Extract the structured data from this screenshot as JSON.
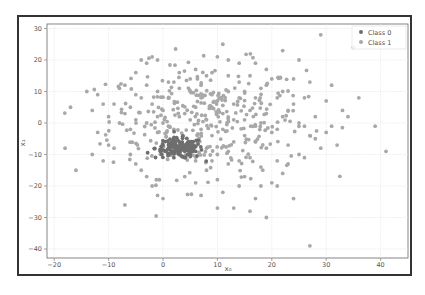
{
  "chart_data": {
    "type": "scatter",
    "title": "",
    "xlabel": "x₀",
    "ylabel": "x₁",
    "xlim": [
      -21.5,
      45
    ],
    "ylim": [
      -42,
      31
    ],
    "x_ticks": [
      -20,
      -10,
      0,
      10,
      20,
      30,
      40
    ],
    "y_ticks": [
      -40,
      -30,
      -20,
      -10,
      0,
      10,
      20,
      30
    ],
    "grid": true,
    "legend_position": "upper right",
    "series": [
      {
        "name": "Class 0",
        "color": "#6e6e6e",
        "cluster_center": [
          3,
          -8
        ],
        "cluster_spread": [
          2.2,
          1.6
        ],
        "approx_count": 150,
        "points": [
          [
            0,
            -7
          ],
          [
            1,
            -8
          ],
          [
            2,
            -9
          ],
          [
            3,
            -8
          ],
          [
            4,
            -7
          ],
          [
            5,
            -8
          ],
          [
            6,
            -9
          ],
          [
            1,
            -10
          ],
          [
            2,
            -6
          ],
          [
            3,
            -10
          ],
          [
            4,
            -9
          ],
          [
            5,
            -6
          ],
          [
            0.5,
            -9
          ],
          [
            2.5,
            -7.5
          ],
          [
            3.5,
            -8.5
          ],
          [
            4.5,
            -10
          ],
          [
            1.5,
            -6.5
          ],
          [
            5.5,
            -7
          ],
          [
            0,
            -8.5
          ],
          [
            6,
            -7.5
          ],
          [
            2,
            -11
          ],
          [
            3,
            -6
          ],
          [
            4,
            -11
          ],
          [
            1,
            -7
          ],
          [
            5,
            -10
          ]
        ]
      },
      {
        "name": "Class 1",
        "color": "#a8a8a8",
        "approx_count": 500,
        "points": [
          [
            -17,
            5
          ],
          [
            -14,
            10
          ],
          [
            -12,
            9
          ],
          [
            -11,
            6
          ],
          [
            -9,
            6
          ],
          [
            -8,
            11
          ],
          [
            -7,
            3
          ],
          [
            -7,
            12
          ],
          [
            -6,
            5
          ],
          [
            -5,
            16
          ],
          [
            -4,
            20
          ],
          [
            -3,
            19
          ],
          [
            -2,
            21
          ],
          [
            -1,
            20
          ],
          [
            -5,
            1
          ],
          [
            -3,
            0
          ],
          [
            -1,
            2
          ],
          [
            0,
            4
          ],
          [
            1,
            8
          ],
          [
            2,
            13
          ],
          [
            3,
            16
          ],
          [
            -18,
            -8
          ],
          [
            -16,
            -15
          ],
          [
            -13,
            -10
          ],
          [
            -10,
            -7
          ],
          [
            -11,
            -12
          ],
          [
            -9,
            -8
          ],
          [
            -6,
            -10
          ],
          [
            -5,
            -13
          ],
          [
            -4,
            -15
          ],
          [
            -3,
            -17
          ],
          [
            -2,
            -20
          ],
          [
            -7,
            -26
          ],
          [
            -1,
            -23
          ],
          [
            0,
            -24
          ],
          [
            4,
            -17
          ],
          [
            6,
            -19
          ],
          [
            7,
            -23
          ],
          [
            8,
            -15
          ],
          [
            9,
            -12
          ],
          [
            10,
            -18
          ],
          [
            11,
            -22
          ],
          [
            12,
            -13
          ],
          [
            13,
            -27
          ],
          [
            14,
            -20
          ],
          [
            15,
            -17
          ],
          [
            16,
            -11
          ],
          [
            17,
            -24
          ],
          [
            18,
            -14
          ],
          [
            19,
            -30
          ],
          [
            20,
            -19
          ],
          [
            21,
            -12
          ],
          [
            22,
            -16
          ],
          [
            24,
            -24
          ],
          [
            27,
            -39
          ],
          [
            26,
            -11
          ],
          [
            28,
            -5
          ],
          [
            30,
            -3
          ],
          [
            32,
            -7
          ],
          [
            34,
            2
          ],
          [
            36,
            8
          ],
          [
            39,
            -1
          ],
          [
            41,
            -9
          ],
          [
            35,
            24
          ],
          [
            29,
            28
          ],
          [
            31,
            12
          ],
          [
            25,
            20
          ],
          [
            22,
            23
          ],
          [
            19,
            17
          ],
          [
            17,
            19
          ],
          [
            14,
            19
          ],
          [
            12,
            20
          ],
          [
            11,
            25
          ],
          [
            10,
            21
          ],
          [
            8,
            15
          ],
          [
            6,
            17
          ],
          [
            5,
            10
          ],
          [
            7,
            8
          ],
          [
            9,
            5
          ],
          [
            11,
            3
          ],
          [
            13,
            6
          ],
          [
            15,
            10
          ],
          [
            16,
            4
          ],
          [
            18,
            0
          ],
          [
            20,
            -3
          ],
          [
            22,
            2
          ],
          [
            24,
            6
          ],
          [
            26,
            -1
          ],
          [
            23,
            -7
          ],
          [
            21,
            8
          ],
          [
            19,
            12
          ],
          [
            17,
            8
          ],
          [
            15,
            -4
          ],
          [
            13,
            -6
          ],
          [
            11,
            -2
          ],
          [
            9,
            -4
          ],
          [
            7,
            -2
          ],
          [
            5,
            1
          ],
          [
            3,
            2
          ],
          [
            1,
            -1
          ],
          [
            -1,
            -3
          ],
          [
            -2,
            6
          ],
          [
            -4,
            8
          ],
          [
            -6,
            -2
          ],
          [
            -8,
            0
          ],
          [
            -10,
            2
          ],
          [
            -12,
            -3
          ],
          [
            -13,
            4
          ],
          [
            12,
            15
          ],
          [
            14,
            13
          ],
          [
            16,
            15
          ],
          [
            18,
            11
          ],
          [
            20,
            14
          ],
          [
            22,
            10
          ],
          [
            24,
            14
          ],
          [
            26,
            8
          ],
          [
            28,
            2
          ],
          [
            30,
            7
          ],
          [
            27,
            13
          ],
          [
            25,
            -10
          ],
          [
            23,
            -13
          ],
          [
            21,
            -20
          ],
          [
            18,
            -20
          ],
          [
            16,
            -28
          ],
          [
            10,
            -27
          ],
          [
            8,
            -8
          ],
          [
            6,
            -12
          ],
          [
            10,
            -10
          ],
          [
            12,
            -9
          ],
          [
            14,
            -12
          ],
          [
            17,
            -6
          ],
          [
            19,
            -8
          ],
          [
            21,
            -2
          ],
          [
            23,
            4
          ],
          [
            25,
            0
          ],
          [
            27,
            -4
          ],
          [
            29,
            -8
          ],
          [
            31,
            -1
          ],
          [
            33,
            4
          ],
          [
            13,
            1
          ],
          [
            15,
            1
          ],
          [
            17,
            -1
          ],
          [
            19,
            3
          ],
          [
            9,
            9
          ],
          [
            7,
            12
          ],
          [
            5,
            14
          ],
          [
            3,
            11
          ],
          [
            1,
            13
          ],
          [
            -1,
            10
          ],
          [
            -3,
            12
          ],
          [
            -5,
            9
          ],
          [
            0,
            0
          ],
          [
            2,
            -2
          ],
          [
            4,
            3
          ],
          [
            6,
            5
          ],
          [
            8,
            1
          ],
          [
            10,
            7
          ],
          [
            12,
            10
          ],
          [
            14,
            8
          ]
        ]
      }
    ]
  },
  "legend": {
    "items": [
      {
        "label": "Class 0",
        "color": "#6e6e6e"
      },
      {
        "label": "Class 1",
        "color": "#a8a8a8"
      }
    ]
  },
  "axes": {
    "xlabel": "x₀",
    "ylabel": "x₁",
    "x_tick_labels": [
      "−20",
      "−10",
      "0",
      "10",
      "20",
      "30",
      "40"
    ],
    "y_tick_labels": [
      "30",
      "20",
      "10",
      "0",
      "−10",
      "−20",
      "−30",
      "−40"
    ]
  }
}
